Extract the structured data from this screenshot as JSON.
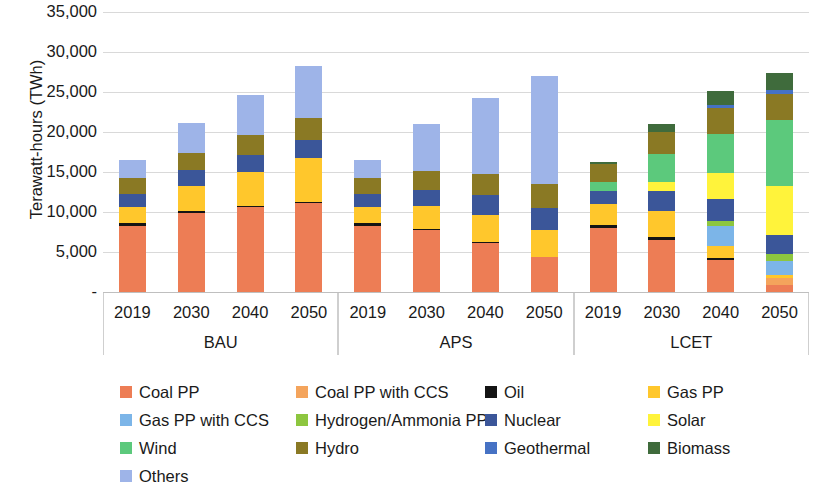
{
  "chart_data": {
    "type": "bar",
    "subtype": "stacked",
    "title": "",
    "xlabel": "",
    "ylabel": "Terawatt-hours (TWh)",
    "ylim": [
      0,
      35000
    ],
    "yticks": [
      0,
      5000,
      10000,
      15000,
      20000,
      25000,
      30000,
      35000
    ],
    "ytick_labels": [
      "-",
      "5,000",
      "10,000",
      "15,000",
      "20,000",
      "25,000",
      "30,000",
      "35,000"
    ],
    "grid": true,
    "legend_position": "bottom",
    "groups": [
      "BAU",
      "APS",
      "LCET"
    ],
    "categories": [
      "2019",
      "2030",
      "2040",
      "2050"
    ],
    "series": [
      {
        "name": "Coal PP",
        "color": "#ED7D55",
        "values": {
          "BAU": [
            8200,
            9900,
            10600,
            11100
          ],
          "APS": [
            8200,
            7700,
            6100,
            4400
          ],
          "LCET": [
            8000,
            6500,
            4000,
            900
          ]
        }
      },
      {
        "name": "Coal PP with CCS",
        "color": "#F4A45C",
        "values": {
          "BAU": [
            0,
            0,
            0,
            0
          ],
          "APS": [
            0,
            0,
            0,
            0
          ],
          "LCET": [
            0,
            0,
            0,
            900
          ]
        }
      },
      {
        "name": "Oil",
        "color": "#141414",
        "values": {
          "BAU": [
            400,
            200,
            200,
            200
          ],
          "APS": [
            400,
            200,
            100,
            0
          ],
          "LCET": [
            400,
            400,
            300,
            0
          ]
        }
      },
      {
        "name": "Gas PP",
        "color": "#FFC72C",
        "values": {
          "BAU": [
            2000,
            3200,
            4200,
            5400
          ],
          "APS": [
            2000,
            2800,
            3400,
            3300
          ],
          "LCET": [
            2600,
            3200,
            1500,
            300
          ]
        }
      },
      {
        "name": "Gas PP with CCS",
        "color": "#7CB5E8",
        "values": {
          "BAU": [
            0,
            0,
            0,
            0
          ],
          "APS": [
            0,
            0,
            0,
            0
          ],
          "LCET": [
            0,
            0,
            2400,
            1800
          ]
        }
      },
      {
        "name": "Hydrogen/Ammonia PP",
        "color": "#8DC63F",
        "values": {
          "BAU": [
            0,
            0,
            0,
            0
          ],
          "APS": [
            0,
            0,
            0,
            0
          ],
          "LCET": [
            0,
            0,
            700,
            900
          ]
        }
      },
      {
        "name": "Nuclear",
        "color": "#3B5699",
        "values": {
          "BAU": [
            1700,
            1900,
            2100,
            2300
          ],
          "APS": [
            1700,
            2000,
            2500,
            2800
          ],
          "LCET": [
            1600,
            2500,
            2700,
            2300
          ]
        }
      },
      {
        "name": "Solar",
        "color": "#FFF33B",
        "values": {
          "BAU": [
            0,
            0,
            0,
            0
          ],
          "APS": [
            0,
            0,
            0,
            0
          ],
          "LCET": [
            0,
            1200,
            3300,
            6200
          ]
        }
      },
      {
        "name": "Wind",
        "color": "#5CC97C",
        "values": {
          "BAU": [
            0,
            0,
            0,
            0
          ],
          "APS": [
            0,
            0,
            0,
            0
          ],
          "LCET": [
            1200,
            3500,
            4800,
            8200
          ]
        }
      },
      {
        "name": "Hydro",
        "color": "#8A7924",
        "values": {
          "BAU": [
            2000,
            2200,
            2500,
            2700
          ],
          "APS": [
            2000,
            2400,
            2700,
            3000
          ],
          "LCET": [
            2200,
            2700,
            3300,
            3300
          ]
        }
      },
      {
        "name": "Geothermal",
        "color": "#4672C4",
        "values": {
          "BAU": [
            0,
            0,
            0,
            0
          ],
          "APS": [
            0,
            0,
            0,
            0
          ],
          "LCET": [
            0,
            0,
            400,
            500
          ]
        }
      },
      {
        "name": "Biomass",
        "color": "#3F6B3C",
        "values": {
          "BAU": [
            0,
            0,
            0,
            0
          ],
          "APS": [
            0,
            0,
            0,
            0
          ],
          "LCET": [
            300,
            1000,
            1700,
            2100
          ]
        }
      },
      {
        "name": "Others",
        "color": "#9EB4E8",
        "values": {
          "BAU": [
            2200,
            3700,
            5000,
            6600
          ],
          "APS": [
            2200,
            5900,
            9400,
            13500
          ],
          "LCET": [
            0,
            0,
            0,
            0
          ]
        }
      }
    ],
    "totals": {
      "BAU": [
        16500,
        21100,
        24600,
        28300
      ],
      "APS": [
        16500,
        21000,
        24200,
        27000
      ],
      "LCET": [
        16300,
        21000,
        25100,
        27400
      ]
    }
  },
  "axis": {
    "y_title": "Terawatt-hours (TWh)",
    "y_ticks": [
      "35,000",
      "30,000",
      "25,000",
      "20,000",
      "15,000",
      "10,000",
      "5,000",
      "-"
    ]
  },
  "groups": [
    {
      "label": "BAU",
      "years": [
        "2019",
        "2030",
        "2040",
        "2050"
      ]
    },
    {
      "label": "APS",
      "years": [
        "2019",
        "2030",
        "2040",
        "2050"
      ]
    },
    {
      "label": "LCET",
      "years": [
        "2019",
        "2030",
        "2040",
        "2050"
      ]
    }
  ],
  "legend": {
    "rows": [
      [
        {
          "label": "Coal PP",
          "color": "#ED7D55"
        },
        {
          "label": "Coal PP with CCS",
          "color": "#F4A45C"
        },
        {
          "label": "Oil",
          "color": "#141414"
        },
        {
          "label": "Gas PP",
          "color": "#FFC72C"
        }
      ],
      [
        {
          "label": "Gas PP with CCS",
          "color": "#7CB5E8"
        },
        {
          "label": "Hydrogen/Ammonia PP",
          "color": "#8DC63F"
        },
        {
          "label": "Nuclear",
          "color": "#3B5699"
        },
        {
          "label": "Solar",
          "color": "#FFF33B"
        }
      ],
      [
        {
          "label": "Wind",
          "color": "#5CC97C"
        },
        {
          "label": "Hydro",
          "color": "#8A7924"
        },
        {
          "label": "Geothermal",
          "color": "#4672C4"
        },
        {
          "label": "Biomass",
          "color": "#3F6B3C"
        }
      ],
      [
        {
          "label": "Others",
          "color": "#9EB4E8"
        }
      ]
    ]
  }
}
